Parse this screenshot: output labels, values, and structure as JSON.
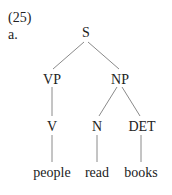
{
  "example": {
    "number": "(25)",
    "sublabel": "a."
  },
  "tree": {
    "nodes": {
      "S": "S",
      "VP": "VP",
      "NP": "NP",
      "V": "V",
      "N": "N",
      "DET": "DET"
    },
    "leaves": {
      "people": "people",
      "read": "read",
      "books": "books"
    },
    "edges": [
      [
        "S",
        "VP"
      ],
      [
        "S",
        "NP"
      ],
      [
        "VP",
        "V"
      ],
      [
        "NP",
        "N"
      ],
      [
        "NP",
        "DET"
      ],
      [
        "V",
        "people"
      ],
      [
        "N",
        "read"
      ],
      [
        "DET",
        "books"
      ]
    ]
  },
  "colors": {
    "text": "#222222",
    "edge": "#8a8a8a",
    "background": "#ffffff"
  }
}
